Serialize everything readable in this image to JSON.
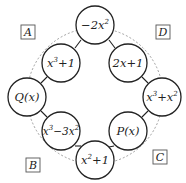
{
  "diagram": {
    "type": "ring-of-circles",
    "ring": {
      "cx": 95,
      "cy": 96,
      "r": 68,
      "style": "dashed"
    },
    "corner_labels": [
      {
        "id": "A",
        "text": "A",
        "x": 28,
        "y": 32
      },
      {
        "id": "B",
        "text": "B",
        "x": 33,
        "y": 165
      },
      {
        "id": "C",
        "text": "C",
        "x": 160,
        "y": 157
      },
      {
        "id": "D",
        "text": "D",
        "x": 163,
        "y": 32
      }
    ],
    "nodes": [
      {
        "id": "top",
        "cx": 95,
        "cy": 25,
        "base": "−2",
        "var": "x",
        "exp": "2",
        "rest": ""
      },
      {
        "id": "upper-left",
        "cx": 61,
        "cy": 63,
        "base": "",
        "var": "x",
        "exp": "3",
        "rest": "+1"
      },
      {
        "id": "upper-right",
        "cx": 128,
        "cy": 63,
        "base": "2",
        "var": "x",
        "exp": "",
        "rest": "+1"
      },
      {
        "id": "left",
        "cx": 27,
        "cy": 97,
        "text": "Q(x)"
      },
      {
        "id": "right",
        "cx": 162,
        "cy": 97,
        "text": "x³+x²"
      },
      {
        "id": "lower-left",
        "cx": 61,
        "cy": 131,
        "text": "x³−3x²"
      },
      {
        "id": "lower-right",
        "cx": 128,
        "cy": 131,
        "text": "P(x)"
      },
      {
        "id": "bottom",
        "cx": 95,
        "cy": 160,
        "text": "x²+1"
      }
    ],
    "node_texts": {
      "top": "−2x²",
      "upper_left": "x³+1",
      "upper_right": "2x+1",
      "left": "Q(x)",
      "right": "x³+x²",
      "lower_left": "x³−3x²",
      "lower_right": "P(x)",
      "bottom": "x²+1"
    },
    "node_parts": {
      "top": {
        "a": "−2x",
        "sup": "2",
        "b": ""
      },
      "upper_left": {
        "a": "x",
        "sup": "3",
        "b": "+1"
      },
      "upper_right": {
        "a": "2x+1",
        "sup": "",
        "b": ""
      },
      "left": {
        "a": "Q(x)",
        "sup": "",
        "b": ""
      },
      "right": {
        "a": "x",
        "sup": "3",
        "b": "+x",
        "sup2": "2"
      },
      "lower_left": {
        "a": "x",
        "sup": "3",
        "b": "−3x",
        "sup2": "2"
      },
      "lower_right": {
        "a": "P(x)",
        "sup": "",
        "b": ""
      },
      "bottom": {
        "a": "x",
        "sup": "2",
        "b": "+1"
      }
    },
    "node_radius": 19
  }
}
